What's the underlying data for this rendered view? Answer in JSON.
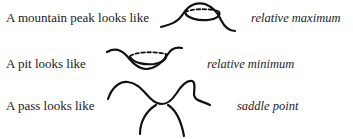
{
  "rows": [
    {
      "description": "A mountain peak looks like",
      "sketch": "mountain-peak-sketch",
      "term": "relative maximum"
    },
    {
      "description": "A pit looks like",
      "sketch": "pit-sketch",
      "term": "relative minimum"
    },
    {
      "description": "A pass looks like",
      "sketch": "saddle-sketch",
      "term": "saddle point"
    }
  ]
}
